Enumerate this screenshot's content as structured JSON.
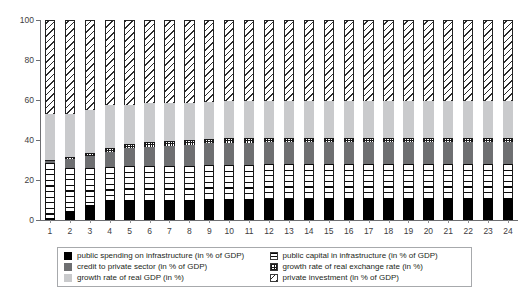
{
  "chart_data": {
    "type": "bar",
    "subtype": "stacked-bar-100",
    "title": "",
    "xlabel": "",
    "ylabel": "",
    "ylim": [
      0,
      100
    ],
    "yticks": [
      0,
      20,
      40,
      60,
      80,
      100
    ],
    "grid": false,
    "legend_position": "bottom",
    "categories": [
      "1",
      "2",
      "3",
      "4",
      "5",
      "6",
      "7",
      "8",
      "9",
      "10",
      "11",
      "12",
      "13",
      "14",
      "15",
      "16",
      "17",
      "18",
      "19",
      "20",
      "21",
      "22",
      "23",
      "24"
    ],
    "series": [
      {
        "name": "public spending on infrastructure (in % of GDP)",
        "pattern": "solid-black",
        "color": "#000000",
        "values": [
          0.8,
          4.5,
          7.5,
          9.8,
          9.8,
          9.8,
          9.8,
          10.0,
          10.5,
          10.5,
          10.5,
          10.6,
          10.6,
          10.6,
          10.8,
          10.8,
          10.8,
          10.8,
          10.8,
          10.8,
          10.8,
          10.8,
          10.8,
          10.8
        ]
      },
      {
        "name": "public capital in infrastructure (in % of GDP)",
        "pattern": "horizontal-lines",
        "color": "#ffffff",
        "values": [
          27.5,
          21.5,
          18.5,
          16.8,
          17.0,
          17.0,
          17.0,
          17.0,
          17.0,
          17.2,
          17.2,
          17.2,
          17.2,
          17.2,
          17.0,
          17.0,
          17.0,
          17.0,
          17.0,
          17.0,
          17.0,
          17.0,
          17.0,
          17.0
        ]
      },
      {
        "name": "credit to private sector (in % of GDP)",
        "pattern": "solid-darkgray",
        "color": "#6e6f71",
        "values": [
          1.2,
          4.5,
          6.0,
          7.5,
          9.0,
          9.8,
          10.3,
          10.6,
          10.8,
          10.9,
          11.0,
          11.0,
          11.0,
          11.0,
          11.0,
          11.0,
          11.0,
          11.0,
          11.0,
          11.0,
          11.0,
          11.0,
          11.0,
          11.0
        ]
      },
      {
        "name": "growth rate of real exchange rate (in %)",
        "pattern": "dotted-grid",
        "color": "#ffffff",
        "values": [
          0.3,
          1.2,
          1.5,
          1.8,
          2.0,
          2.2,
          2.3,
          2.4,
          2.4,
          2.4,
          2.4,
          2.4,
          2.4,
          2.4,
          2.4,
          2.4,
          2.4,
          2.4,
          2.4,
          2.4,
          2.4,
          2.4,
          2.4,
          2.4
        ]
      },
      {
        "name": "growth rate of real GDP (in %)",
        "pattern": "solid-lightgray",
        "color": "#c9cacc",
        "values": [
          23.2,
          21.3,
          21.5,
          21.6,
          19.7,
          19.6,
          19.1,
          18.6,
          18.3,
          18.5,
          18.4,
          18.3,
          18.3,
          18.3,
          18.3,
          18.3,
          18.3,
          18.3,
          18.3,
          18.3,
          18.3,
          18.3,
          18.3,
          18.3
        ]
      },
      {
        "name": "private investment (in % of GDP)",
        "pattern": "diagonal-hatch",
        "color": "#ffffff",
        "values": [
          47.0,
          47.0,
          45.0,
          42.5,
          42.5,
          41.6,
          41.5,
          41.4,
          41.0,
          40.5,
          40.5,
          40.5,
          40.5,
          40.5,
          40.5,
          40.5,
          40.5,
          40.5,
          40.5,
          40.5,
          40.5,
          40.5,
          40.5,
          40.5
        ]
      }
    ]
  },
  "axis": {
    "y_tick_labels": [
      "0",
      "20",
      "40",
      "60",
      "80",
      "100"
    ]
  },
  "legend": {
    "items": [
      {
        "label": "public spending on infrastructure (in % of GDP)",
        "swatch": "solid-black-swatch"
      },
      {
        "label": "public capital in infrastructure (in % of GDP)",
        "swatch": "horizontal-lines-swatch"
      },
      {
        "label": "credit to private sector (in % of GDP)",
        "swatch": "solid-darkgray-swatch"
      },
      {
        "label": "growth rate of real exchange rate (in %)",
        "swatch": "dotted-grid-swatch"
      },
      {
        "label": "growth rate of real GDP (in %)",
        "swatch": "solid-lightgray-swatch"
      },
      {
        "label": "private investment (in % of GDP)",
        "swatch": "diagonal-hatch-swatch"
      }
    ]
  }
}
